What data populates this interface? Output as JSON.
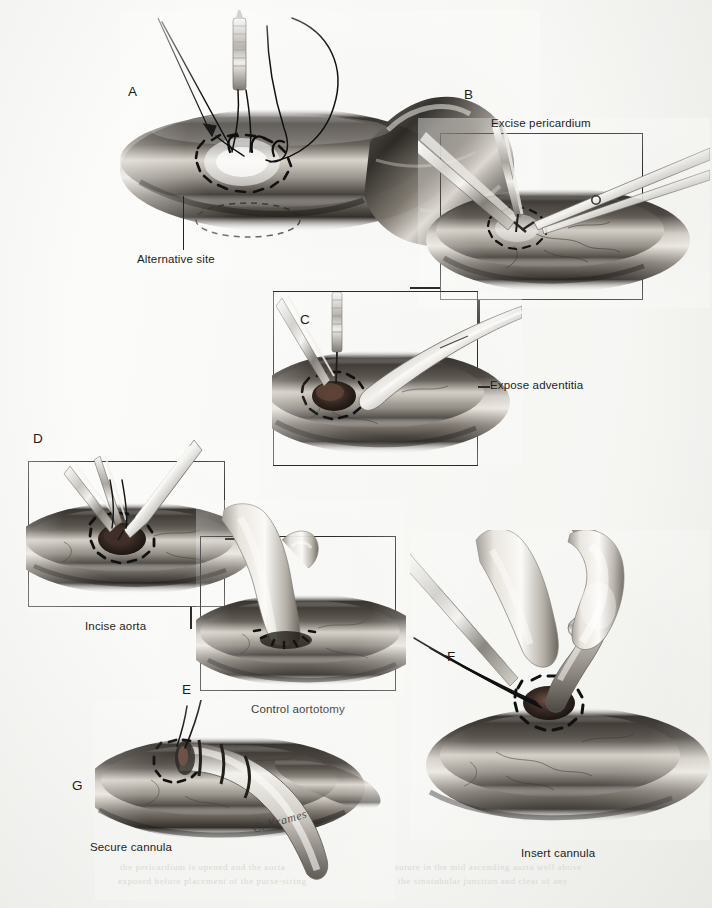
{
  "figure": {
    "background_color": "#fbfbf9",
    "ink_color": "#1d1d1d",
    "width": 712,
    "height": 908
  },
  "panels": [
    {
      "id": "A",
      "letter": "A",
      "caption": "Alternative site",
      "framed": false,
      "has_leader_line": true,
      "subject": "ascending aorta with purse-string sutures, needle holder and suture loops; aortic arch and innominate region at right"
    },
    {
      "id": "B",
      "letter": "B",
      "caption": "Excise pericardium",
      "caption_position": "above-frame",
      "framed": true,
      "subject": "forceps lifting pericardial reflection while scissors excise overlying pericardium within purse-string"
    },
    {
      "id": "C",
      "letter": "C",
      "caption": "Expose adventitia",
      "caption_position": "right-of-frame",
      "framed": true,
      "subject": "curved clamp and forceps exposing aortic adventitia inside the purse-string circle"
    },
    {
      "id": "D",
      "letter": "D",
      "caption": "Incise aorta",
      "caption_position": "below-frame",
      "framed": true,
      "subject": "scalpel/forceps making the aortotomy incision at the centre of the purse-string"
    },
    {
      "id": "E",
      "letter": "E",
      "caption": "Control aortotomy",
      "caption_position": "below-frame",
      "framed": true,
      "subject": "index finger occluding the aortotomy to control bleeding"
    },
    {
      "id": "F",
      "letter": "F",
      "caption": "Insert cannula",
      "caption_position": "below",
      "framed": false,
      "subject": "gloved fingers guiding the arterial cannula tip through the aortotomy while sutures are held"
    },
    {
      "id": "G",
      "letter": "G",
      "caption": "Secure cannula",
      "caption_position": "below-left",
      "framed": false,
      "subject": "cannula seated in aorta, purse-string snared with tourniquet and tie securing the cannula"
    }
  ],
  "annotations": {
    "artist_signature": "C. Krames",
    "bleed_through_lines": [
      "the pericardium is opened and the aorta",
      "exposed before placement of the purse-string",
      "suture in the mid ascending aorta well above",
      "the sinotubular junction and clear of any"
    ]
  },
  "colors": {
    "ink": "#1d1d1d",
    "frame": "#2b2b2b",
    "paper": "#fbfbf9",
    "tissue_dark": "#2a2724",
    "tissue_mid": "#6e6a64",
    "tissue_light": "#d8d4cd",
    "metal_light": "#efeeea",
    "metal_mid": "#9a9791",
    "suture": "#151515"
  }
}
